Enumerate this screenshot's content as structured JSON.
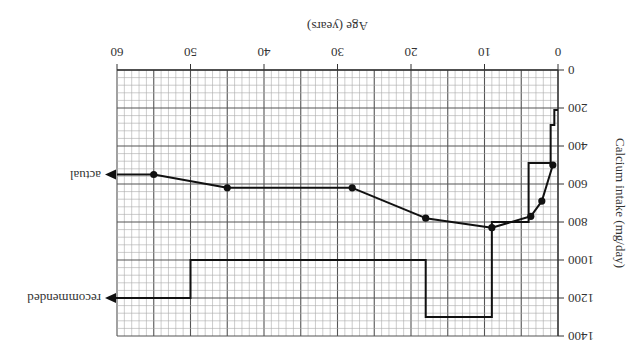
{
  "chart_data": {
    "type": "line",
    "orientation_note": "figure rendered rotated 180 degrees",
    "title": "",
    "xlabel": "Age (years)",
    "ylabel": "Calcium intake (mg/day)",
    "xlim": [
      0,
      60
    ],
    "ylim": [
      0,
      1400
    ],
    "x_ticks": [
      "0",
      "10",
      "20",
      "30",
      "40",
      "50",
      "60"
    ],
    "y_ticks": [
      "0",
      "200",
      "400",
      "600",
      "800",
      "1000",
      "1200",
      "1400"
    ],
    "grid": true,
    "series": [
      {
        "name": "actual",
        "style": "line with markers",
        "points": [
          {
            "age": 0.7,
            "mg": 500
          },
          {
            "age": 2.2,
            "mg": 690
          },
          {
            "age": 3.7,
            "mg": 770
          },
          {
            "age": 9,
            "mg": 830
          },
          {
            "age": 18,
            "mg": 780
          },
          {
            "age": 28,
            "mg": 620
          },
          {
            "age": 45,
            "mg": 620
          },
          {
            "age": 55,
            "mg": 550
          }
        ],
        "continues_to": {
          "age": 60,
          "mg": 550
        }
      },
      {
        "name": "recommended",
        "style": "step",
        "steps": [
          {
            "from_age": 0,
            "to_age": 0.5,
            "mg": 210
          },
          {
            "from_age": 0.5,
            "to_age": 1,
            "mg": 290
          },
          {
            "from_age": 1,
            "to_age": 4,
            "mg": 490
          },
          {
            "from_age": 4,
            "to_age": 9,
            "mg": 800
          },
          {
            "from_age": 9,
            "to_age": 18,
            "mg": 1300
          },
          {
            "from_age": 18,
            "to_age": 50,
            "mg": 1000
          },
          {
            "from_age": 50,
            "to_age": 60,
            "mg": 1200
          }
        ]
      }
    ],
    "legend": [
      {
        "label": "actual",
        "position": "arrow at right end of actual line"
      },
      {
        "label": "recommended",
        "position": "arrow at right end of recommended line"
      }
    ]
  },
  "labels": {
    "xlabel": "Age (years)",
    "ylabel": "Calcium intake (mg/day)",
    "actual": "actual",
    "recommended": "recommended"
  }
}
